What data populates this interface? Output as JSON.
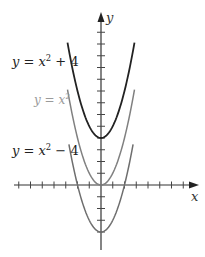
{
  "chart_data": {
    "type": "line",
    "title": "",
    "xlabel": "x",
    "ylabel": "y",
    "xlim": [
      -7,
      7
    ],
    "ylim": [
      -5,
      14
    ],
    "grid": false,
    "legend_position": "inline labels left of curves",
    "x_ticks": [
      -7,
      -6,
      -5,
      -4,
      -3,
      -2,
      -1,
      1,
      2,
      3,
      4,
      5,
      6,
      7
    ],
    "y_ticks": [
      -4,
      -3,
      -2,
      -1,
      1,
      2,
      3,
      4,
      5,
      6,
      7,
      8,
      9,
      10,
      11,
      12,
      13,
      14
    ],
    "tick_labels_shown": false,
    "series": [
      {
        "name": "y = x² + 4",
        "label_main": "y = x",
        "label_exp": "2",
        "label_tail": " + 4",
        "color": "#222222",
        "equation": "x^2 + 4",
        "vertex": [
          0,
          4
        ],
        "x": [
          -2.85,
          -2,
          -1,
          0,
          1,
          2,
          2.85
        ],
        "values": [
          12.12,
          8,
          5,
          4,
          5,
          8,
          12.12
        ]
      },
      {
        "name": "y = x²",
        "label_main": "y = x",
        "label_exp": "2",
        "label_tail": "",
        "color": "#808080",
        "equation": "x^2",
        "vertex": [
          0,
          0
        ],
        "x": [
          -2.85,
          -2,
          -1,
          0,
          1,
          2,
          2.85
        ],
        "values": [
          8.12,
          4,
          1,
          0,
          1,
          4,
          8.12
        ]
      },
      {
        "name": "y = x² − 4",
        "label_main": "y = x",
        "label_exp": "2",
        "label_tail": " − 4",
        "color": "#6e6e6e",
        "equation": "x^2 - 4",
        "vertex": [
          0,
          -4
        ],
        "x": [
          -2.73,
          -2,
          -1,
          0,
          1,
          2,
          2.73
        ],
        "values": [
          3.45,
          0,
          -3,
          -4,
          -3,
          0,
          3.45
        ]
      }
    ]
  },
  "axes": {
    "x_label": "x",
    "y_label": "y"
  }
}
